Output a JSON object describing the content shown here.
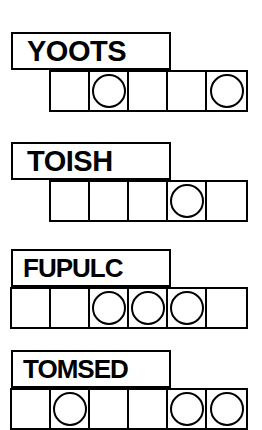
{
  "worksheet": {
    "title": "Word Box Worksheet",
    "background_color": "#ffffff",
    "ink_color": "#000000"
  },
  "groups": [
    {
      "word": "YOOTS",
      "letter_count": 5,
      "box_count": 5,
      "strip_left": 49,
      "strip_top": 70,
      "box_width": 39,
      "box_height": 38,
      "label_top": 32,
      "circled_boxes": [
        2,
        5
      ]
    },
    {
      "word": "TOISH",
      "letter_count": 5,
      "box_count": 5,
      "strip_left": 49,
      "strip_top": 180,
      "box_width": 39,
      "box_height": 38,
      "label_top": 142,
      "circled_boxes": [
        4
      ]
    },
    {
      "word": "FUPULC",
      "letter_count": 6,
      "box_count": 6,
      "strip_left": 10,
      "strip_top": 287,
      "box_width": 39,
      "box_height": 38,
      "label_top": 249,
      "circled_boxes": [
        3,
        4,
        5
      ]
    },
    {
      "word": "TOMSED",
      "letter_count": 6,
      "box_count": 6,
      "strip_left": 10,
      "strip_top": 388,
      "box_width": 39,
      "box_height": 38,
      "label_top": 350,
      "circled_boxes": [
        2,
        5,
        6
      ]
    }
  ]
}
